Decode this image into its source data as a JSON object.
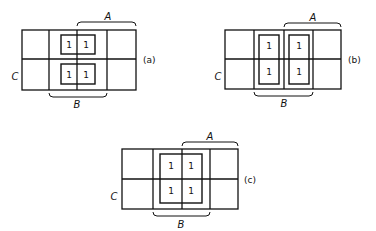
{
  "diagrams": [
    {
      "id": "a",
      "label": "(a)",
      "var_a": "A",
      "var_b": "B",
      "var_c": "C",
      "cells": [
        [
          "",
          "1",
          "1",
          ""
        ],
        [
          "",
          "1",
          "1",
          ""
        ]
      ],
      "groups": "two 1x2 groups spanning columns 2-3 in each row"
    },
    {
      "id": "b",
      "label": "(b)",
      "var_a": "A",
      "var_b": "B",
      "var_c": "C",
      "cells": [
        [
          "",
          "1",
          "1",
          ""
        ],
        [
          "",
          "1",
          "1",
          ""
        ]
      ],
      "groups": "two 2x1 groups, column 2 and column 3 each spanning both rows"
    },
    {
      "id": "c",
      "label": "(c)",
      "var_a": "A",
      "var_b": "B",
      "var_c": "C",
      "cells": [
        [
          "",
          "1",
          "1",
          ""
        ],
        [
          "",
          "1",
          "1",
          ""
        ]
      ],
      "groups": "one 2x2 group spanning columns 2-3 and both rows"
    }
  ]
}
